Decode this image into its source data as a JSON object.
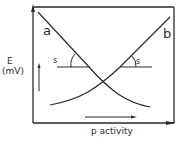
{
  "diagram": {
    "type": "electrode-response-curves",
    "y_axis": {
      "label_line1": "E",
      "label_line2": "(mV)"
    },
    "x_axis": {
      "label": "p activity"
    },
    "curves": [
      {
        "id": "a",
        "label": "a",
        "direction": "decreasing"
      },
      {
        "id": "b",
        "label": "b",
        "direction": "increasing"
      }
    ],
    "slope_labels": [
      {
        "label": "s",
        "curve": "a"
      },
      {
        "label": "s",
        "curve": "b"
      }
    ],
    "colors": {
      "ink": "#2a2a2a",
      "background": "#ffffff"
    }
  }
}
